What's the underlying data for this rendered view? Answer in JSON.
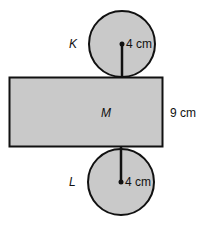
{
  "diagram": {
    "type": "cylinder-net",
    "colors": {
      "fill": "#c9c9c9",
      "stroke": "#111111",
      "background": "#ffffff"
    },
    "top_circle": {
      "label": "K",
      "radius_label": "4 cm"
    },
    "rectangle": {
      "label": "M",
      "height_label": "9 cm"
    },
    "bottom_circle": {
      "label": "L",
      "radius_label": "4 cm"
    }
  }
}
